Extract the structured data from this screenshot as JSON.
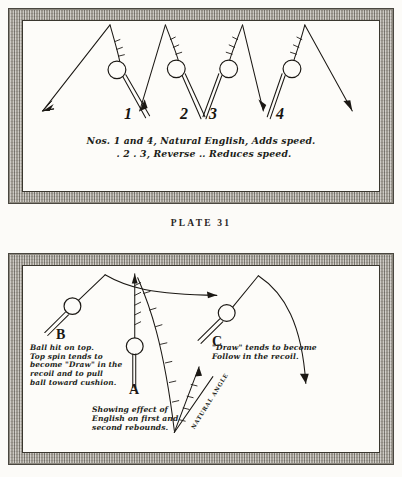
{
  "page": {
    "plate_label": "PLATE 31",
    "ink_color": "#1b1814",
    "paper_color": "#fcfbf8",
    "frame_color": "#b9b5ad"
  },
  "diagram_top": {
    "name": "english-effects-on-cushion",
    "shot_numbers": [
      "1",
      "2",
      "3",
      "4"
    ],
    "caption_line_1": "Nos. 1 and 4, Natural English, Adds speed.",
    "caption_line_2": ".  2  .   3, Reverse        ..        Reduces  speed.",
    "shots": [
      {
        "label": "1",
        "spin": "natural",
        "effect": "adds speed"
      },
      {
        "label": "2",
        "spin": "reverse",
        "effect": "reduces speed"
      },
      {
        "label": "3",
        "spin": "reverse",
        "effect": "reduces speed"
      },
      {
        "label": "4",
        "spin": "natural",
        "effect": "adds speed"
      }
    ]
  },
  "diagram_bottom": {
    "name": "english-on-rebounds",
    "ball_b_letter": "B",
    "ball_a_letter": "A",
    "ball_c_letter": "C",
    "caption_b": "Ball hit on top.\nTop spin tends to\nbecome \"Draw\" in the\nrecoil and to pull\nball toward cushion.",
    "caption_a": "Showing effect of\nEnglish on first and\nsecond rebounds.",
    "caption_c": "\"Draw\" tends to become\nFollow in the recoil.",
    "angle_label": "NATURAL ANGLE"
  }
}
